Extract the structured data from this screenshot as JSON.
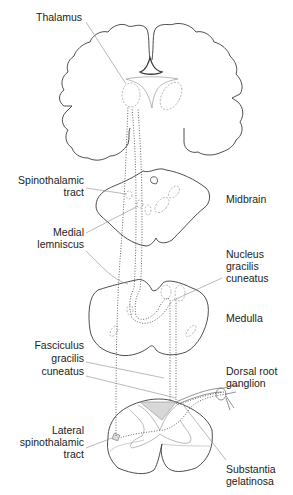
{
  "diagram": {
    "type": "anatomical pathway diagram",
    "colors": {
      "outline": "#3a3a3a",
      "leader": "#8a8a8a",
      "tract": "#555555",
      "shade": "#d8d8d8"
    },
    "structures": [
      "Cerebrum (coronal section)",
      "Midbrain",
      "Medulla",
      "Spinal cord"
    ],
    "labels": {
      "thalamus": "Thalamus",
      "spinothalamic_1": "Spinothalamic",
      "spinothalamic_2": "tract",
      "midbrain": "Midbrain",
      "medial_1": "Medial",
      "medial_2": "lemniscus",
      "nucleus_1": "Nucleus",
      "nucleus_2": "gracilis",
      "nucleus_3": "cuneatus",
      "medulla": "Medulla",
      "fasciculus_1": "Fasciculus",
      "fasciculus_2": "gracilis",
      "fasciculus_3": "cuneatus",
      "drg_1": "Dorsal root",
      "drg_2": "ganglion",
      "lateral_1": "Lateral",
      "lateral_2": "spinothalamic",
      "lateral_3": "tract",
      "substantia_1": "Substantia",
      "substantia_2": "gelatinosa"
    }
  }
}
